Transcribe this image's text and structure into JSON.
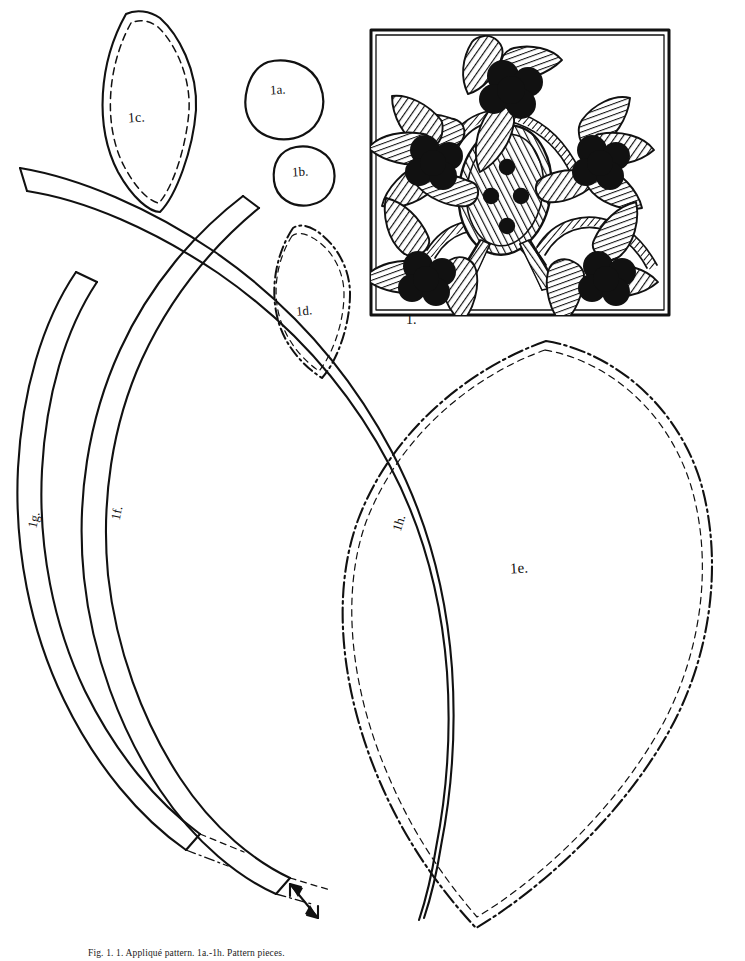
{
  "sheet": {
    "title": "Appliqué and Embroidery Pattern Sheet",
    "background_color": "#ffffff",
    "ink_color": "#111111",
    "caption": "Fig. 1. 1. Appliqué pattern. 1a.-1h. Pattern pieces."
  },
  "pieces": [
    {
      "id": "1a",
      "label": "1a.",
      "shape": "circle",
      "line": "solid",
      "description": "small circle appliqué piece"
    },
    {
      "id": "1b",
      "label": "1b.",
      "shape": "circle",
      "line": "solid",
      "description": "smaller circle appliqué piece"
    },
    {
      "id": "1c",
      "label": "1c.",
      "shape": "pointed-oval",
      "line": "solid+dashed",
      "description": "leaf shape with inner stitching line"
    },
    {
      "id": "1d",
      "label": "1d.",
      "shape": "pointed-oval",
      "line": "dashdot+dashed",
      "description": "small leaf shape, dash-dot outline"
    },
    {
      "id": "1e",
      "label": "1e.",
      "shape": "large-leaf",
      "line": "dashdot+dashed",
      "description": "large pointed oval body piece"
    },
    {
      "id": "1f",
      "label": "1f.",
      "shape": "curved-strip",
      "line": "solid",
      "description": "long curved stem strip"
    },
    {
      "id": "1g",
      "label": "1g.",
      "shape": "curved-strip",
      "line": "solid",
      "description": "outer long curved stem strip"
    },
    {
      "id": "1h",
      "label": "1h.",
      "shape": "curved-strip",
      "line": "solid",
      "description": "long diagonal curved stem strip"
    }
  ],
  "design": {
    "label": "1.",
    "frame": {
      "line": "solid",
      "description": "rectangular border frame"
    },
    "motif": "floral vine with hatched leaves, solid berry clusters and a central hatched oval pod",
    "element_counts": {
      "flower_clusters": 5,
      "leaves": 14,
      "pod_dots": 4,
      "vine_arcs": 4
    }
  }
}
